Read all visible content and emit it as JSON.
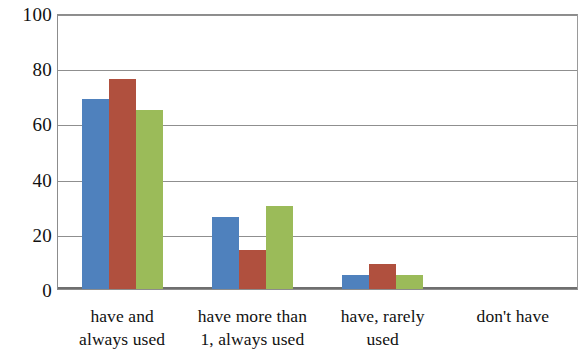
{
  "chart_data": {
    "type": "bar",
    "title": "",
    "subtitle": "",
    "xlabel": "",
    "ylabel": "",
    "ylim": [
      0,
      100
    ],
    "yticks": [
      0,
      20,
      40,
      60,
      80,
      100
    ],
    "grid": true,
    "legend_position": "none",
    "categories": [
      "have and always used",
      "have more than 1, always used",
      "have, rarely used",
      "don't have"
    ],
    "category_lines": [
      [
        "have and",
        "always used"
      ],
      [
        "have more than",
        "1, always used"
      ],
      [
        "have, rarely",
        "used"
      ],
      [
        "don't have",
        ""
      ]
    ],
    "series": [
      {
        "name": "Series 1",
        "color": "#4f81bd",
        "values": [
          69,
          26,
          5,
          0
        ]
      },
      {
        "name": "Series 2",
        "color": "#b0503e",
        "values": [
          76,
          14,
          9,
          0
        ]
      },
      {
        "name": "Series 3",
        "color": "#9bbb59",
        "values": [
          65,
          30,
          5,
          0
        ]
      }
    ]
  }
}
